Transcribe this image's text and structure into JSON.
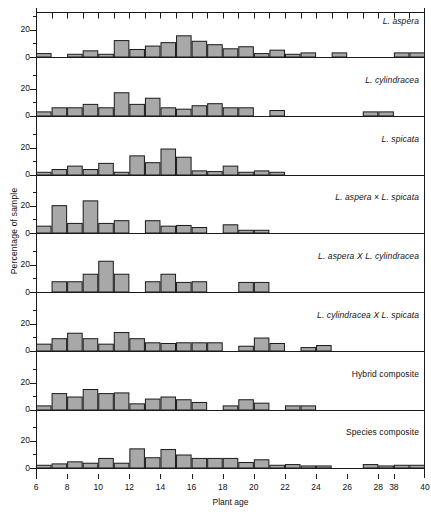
{
  "chart_data": {
    "type": "bar",
    "title": "",
    "xlabel": "Plant age",
    "ylabel": "Percentage of sample",
    "ylim": [
      0,
      30
    ],
    "yticks": [
      0,
      20
    ],
    "yticks_minor": [
      10,
      30
    ],
    "grid": false,
    "legend": "panel-right-inset",
    "axis_break": "between 28 and 38",
    "bin_width": 1,
    "xlim": [
      6,
      40
    ],
    "x_tick_labels": [
      "6",
      "8",
      "10",
      "12",
      "14",
      "16",
      "18",
      "20",
      "22",
      "24",
      "26",
      "28",
      "38",
      "40"
    ],
    "x_tick_values": [
      6,
      8,
      10,
      12,
      14,
      16,
      18,
      20,
      22,
      24,
      26,
      28,
      30,
      31
    ],
    "x_slot_count": 25,
    "x_slot_starts": [
      6,
      7,
      8,
      9,
      10,
      11,
      12,
      13,
      14,
      15,
      16,
      17,
      18,
      19,
      20,
      21,
      22,
      23,
      24,
      25,
      26,
      27,
      28,
      38,
      39
    ],
    "panels": [
      {
        "label": "L. aspera",
        "italic": true,
        "values": [
          2.5,
          0,
          2.0,
          4.5,
          2.0,
          12.0,
          5.5,
          8.0,
          10.5,
          15.5,
          11.5,
          9.0,
          6.0,
          7.5,
          2.5,
          5.0,
          2.0,
          3.0,
          0,
          3.0,
          0,
          0,
          0,
          3.0,
          3.0
        ]
      },
      {
        "label": "L. cylindracea",
        "italic": true,
        "values": [
          3.0,
          6.0,
          6.0,
          8.5,
          6.0,
          17.0,
          8.5,
          13.0,
          6.0,
          5.0,
          7.5,
          9.0,
          6.0,
          6.0,
          0,
          4.0,
          0,
          0,
          0,
          0,
          0,
          3.0,
          3.0,
          0,
          0
        ]
      },
      {
        "label": "L. spicata",
        "italic": true,
        "values": [
          2.0,
          4.0,
          6.5,
          4.0,
          8.5,
          2.0,
          14.0,
          9.0,
          19.0,
          13.0,
          3.0,
          2.5,
          6.5,
          2.0,
          3.0,
          2.0,
          0,
          0,
          0,
          0,
          0,
          0,
          0,
          0,
          0
        ]
      },
      {
        "label": "L. aspera × L. spicata",
        "italic": true,
        "values": [
          5.0,
          20.0,
          7.0,
          23.5,
          7.0,
          9.0,
          0,
          9.0,
          5.0,
          5.5,
          4.0,
          0,
          6.0,
          2.0,
          2.0,
          0,
          0,
          0,
          0,
          0,
          0,
          0,
          0,
          0,
          0
        ]
      },
      {
        "label": "L. aspera X L. cylindracea",
        "italic": true,
        "values": [
          0,
          7.5,
          7.5,
          13.0,
          22.5,
          13.0,
          0,
          7.5,
          13.0,
          7.0,
          7.5,
          0,
          0,
          7.0,
          7.0,
          0,
          0,
          0,
          0,
          0,
          0,
          0,
          0,
          0,
          0
        ]
      },
      {
        "label": "L. cylindracea X L. spicata",
        "italic": true,
        "values": [
          5.0,
          9.0,
          13.0,
          9.0,
          5.0,
          13.5,
          9.0,
          6.0,
          5.5,
          6.0,
          6.0,
          6.0,
          0,
          3.5,
          9.5,
          5.5,
          0,
          2.5,
          4.0,
          0,
          0,
          0,
          0,
          0,
          0
        ]
      },
      {
        "label": "Hybrid composite",
        "italic": false,
        "values": [
          3.0,
          12.0,
          9.5,
          15.0,
          12.0,
          12.5,
          4.5,
          8.0,
          9.5,
          7.5,
          5.5,
          0,
          3.0,
          7.5,
          5.0,
          0,
          3.0,
          3.0,
          0,
          0,
          0,
          0,
          0,
          0,
          0
        ]
      },
      {
        "label": "Species composite",
        "italic": false,
        "values": [
          2.0,
          3.0,
          4.5,
          3.5,
          7.0,
          3.5,
          14.0,
          7.5,
          13.5,
          9.5,
          7.0,
          7.0,
          7.0,
          4.0,
          6.0,
          2.0,
          2.5,
          1.5,
          1.5,
          0,
          0,
          2.5,
          1.5,
          2.0,
          2.0
        ]
      }
    ],
    "colors": {
      "bar_fill": "#a8a8a8",
      "bar_stroke": "#1a1a1a",
      "axis": "#1a1a1a",
      "text": "#111111",
      "background": "#ffffff"
    }
  }
}
